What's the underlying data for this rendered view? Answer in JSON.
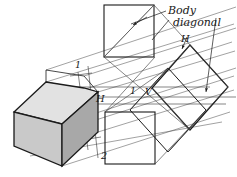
{
  "figure": {
    "title_label": "Body diagonal",
    "callout_lines": [
      {
        "name": "body-diagonal-callout-upper",
        "x1": 168,
        "y1": 11,
        "x2": 130,
        "y2": 24
      },
      {
        "name": "body-diagonal-callout-lower",
        "x1": 170,
        "y1": 20,
        "x2": 152,
        "y2": 39
      }
    ],
    "labels": [
      {
        "id": "label-1-upper",
        "text": "1",
        "x": 75,
        "y": 68,
        "cls": "label-point"
      },
      {
        "id": "label-2-lower",
        "text": "2",
        "x": 101,
        "y": 159,
        "cls": "label-point"
      },
      {
        "id": "label-H-left",
        "text": "H",
        "x": 96,
        "y": 102,
        "cls": "label-plane"
      },
      {
        "id": "label-1-mid",
        "text": "1",
        "x": 130,
        "y": 94,
        "cls": "label-point"
      },
      {
        "id": "label-V-mid",
        "text": "V",
        "x": 145,
        "y": 95,
        "cls": "label-point"
      },
      {
        "id": "label-H-right",
        "text": "H",
        "x": 181,
        "y": 42,
        "cls": "label-plane"
      }
    ],
    "colors": {
      "ink": "#1a1a1a",
      "thin_ink": "#4a4a4a",
      "face_top": "#e2e2e2",
      "face_left": "#c9c9c9",
      "face_right": "#a8a8a8",
      "paper": "#ffffff"
    },
    "solid": {
      "name": "shaded-cube",
      "top_face": "14,112 46,82 84,88 98,92 62,124",
      "left_face": "14,112 14,146 62,166 62,124",
      "right_face": "62,124 98,92 98,132 62,166",
      "back_edges": "46,82 46,70 84,76 98,92"
    },
    "squares": {
      "top_view": {
        "name": "square-top-projection",
        "x": 104,
        "y": 5,
        "w": 50,
        "h": 52
      },
      "bottom_view": {
        "name": "square-bottom-projection",
        "x": 105,
        "y": 112,
        "w": 50,
        "h": 52
      },
      "rotated_view": {
        "name": "square-rotated-projection",
        "points": "190,45 228,87 190,130 152,88"
      }
    },
    "arrows": [
      {
        "id": "arrow-top-square-diagonal",
        "x1": 145,
        "y1": 18,
        "x2": 133,
        "y2": 25
      },
      {
        "id": "arrow-rotated-H",
        "x1": 186,
        "y1": 38,
        "x2": 182,
        "y2": 49
      },
      {
        "id": "arrow-right-vertical",
        "x1": 215,
        "y1": 20,
        "x2": 206,
        "y2": 92
      }
    ],
    "projection_rays_count": 10,
    "construction_lines_count": 16
  }
}
